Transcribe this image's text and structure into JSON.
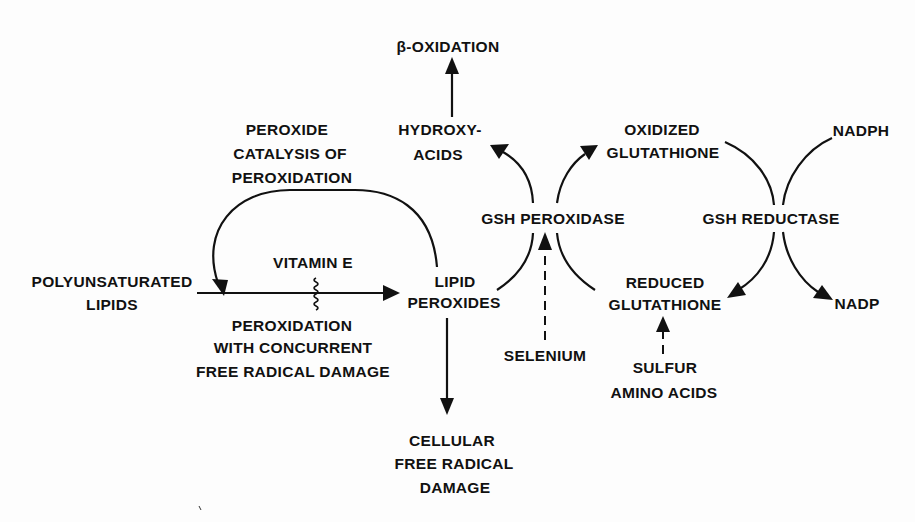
{
  "diagram": {
    "type": "metabolic-pathway",
    "nodes": {
      "beta_oxidation": {
        "label": "β-OXIDATION"
      },
      "hydroxy_acids": {
        "lines": [
          "HYDROXY-",
          "ACIDS"
        ]
      },
      "oxidized_glutathione": {
        "lines": [
          "OXIDIZED",
          "GLUTATHIONE"
        ]
      },
      "nadph": {
        "label": "NADPH"
      },
      "peroxide_catalysis": {
        "lines": [
          "PEROXIDE",
          "CATALYSIS OF",
          "PEROXIDATION"
        ]
      },
      "vitamin_e": {
        "label": "VITAMIN  E"
      },
      "polyunsaturated_lipids": {
        "lines": [
          "POLYUNSATURATED",
          "LIPIDS"
        ]
      },
      "lipid_peroxides": {
        "lines": [
          "LIPID",
          "PEROXIDES"
        ]
      },
      "peroxidation_damage": {
        "lines": [
          "PEROXIDATION",
          "WITH CONCURRENT",
          "FREE RADICAL DAMAGE"
        ]
      },
      "gsh_peroxidase": {
        "label": "GSH  PEROXIDASE"
      },
      "gsh_reductase": {
        "label": "GSH  REDUCTASE"
      },
      "reduced_glutathione": {
        "lines": [
          "REDUCED",
          "GLUTATHIONE"
        ]
      },
      "nadp": {
        "label": "NADP"
      },
      "selenium": {
        "label": "SELENIUM"
      },
      "sulfur_amino_acids": {
        "lines": [
          "SULFUR",
          "AMINO ACIDS"
        ]
      },
      "cellular_damage": {
        "lines": [
          "CELLULAR",
          "FREE  RADICAL",
          "DAMAGE"
        ]
      }
    },
    "edges": [
      {
        "from": "POLYUNSATURATED LIPIDS",
        "to": "LIPID PEROXIDES",
        "style": "solid",
        "inhibited_by": "VITAMIN E"
      },
      {
        "from": "LIPID PEROXIDES",
        "to": "POLYUNSATURATED LIPIDS",
        "style": "solid-curved",
        "label": "PEROXIDE CATALYSIS OF PEROXIDATION"
      },
      {
        "from": "LIPID PEROXIDES",
        "to": "HYDROXY-ACIDS",
        "style": "solid-curved",
        "via": "GSH PEROXIDASE"
      },
      {
        "from": "HYDROXY-ACIDS",
        "to": "β-OXIDATION",
        "style": "solid"
      },
      {
        "from": "REDUCED GLUTATHIONE",
        "to": "OXIDIZED GLUTATHIONE",
        "style": "solid-curved",
        "via": "GSH PEROXIDASE"
      },
      {
        "from": "OXIDIZED GLUTATHIONE",
        "to": "REDUCED GLUTATHIONE",
        "style": "solid-curved",
        "via": "GSH REDUCTASE"
      },
      {
        "from": "NADPH",
        "to": "NADP",
        "style": "solid-curved",
        "via": "GSH REDUCTASE"
      },
      {
        "from": "SELENIUM",
        "to": "GSH PEROXIDASE",
        "style": "dashed"
      },
      {
        "from": "SULFUR AMINO ACIDS",
        "to": "REDUCED GLUTATHIONE",
        "style": "dashed"
      },
      {
        "from": "LIPID PEROXIDES",
        "to": "CELLULAR FREE RADICAL DAMAGE",
        "style": "solid"
      }
    ],
    "colors": {
      "ink": "#111111",
      "paper": "#fdfdfd"
    }
  }
}
